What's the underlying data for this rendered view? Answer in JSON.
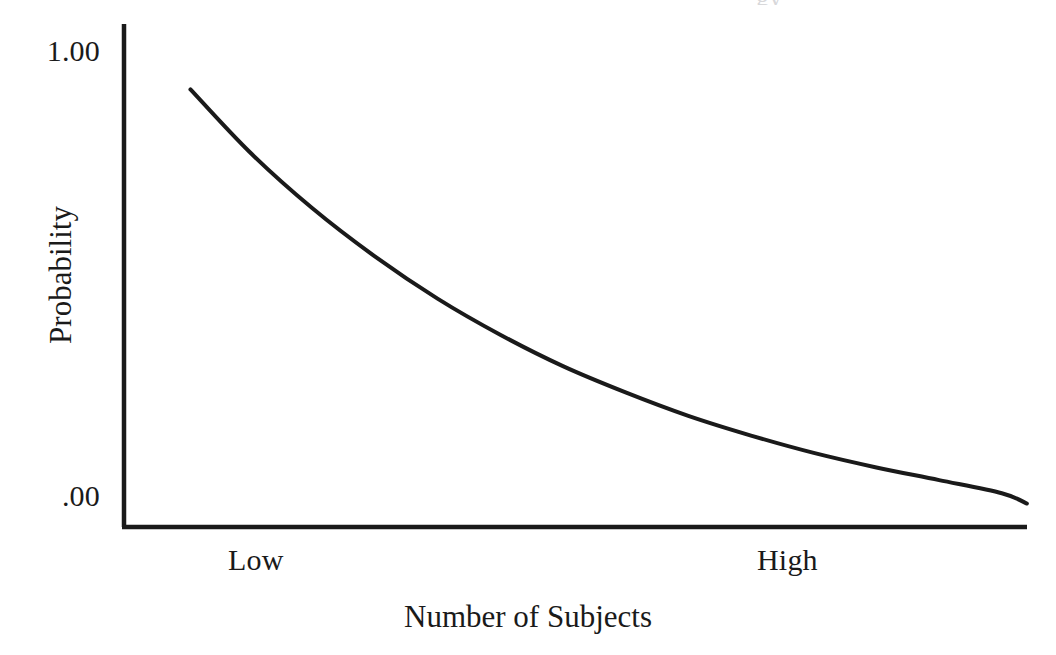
{
  "figure": {
    "background_color": "#ffffff",
    "ink_color": "#1a1a1a",
    "artifact_glyph": "gy"
  },
  "axes": {
    "y_title": "Probability",
    "x_title": "Number of Subjects",
    "y_ticks": [
      "1.00",
      ".00"
    ],
    "x_ticks": [
      "Low",
      "High"
    ]
  },
  "chart_data": {
    "type": "line",
    "title": "",
    "subtitle": "",
    "xlabel": "Number of Subjects",
    "ylabel": "Probability",
    "xlim": [
      0,
      1
    ],
    "ylim": [
      0,
      1
    ],
    "x_tick_labels": [
      "Low",
      "High"
    ],
    "x_tick_values": [
      0.08,
      0.72
    ],
    "y_tick_labels": [
      "1.00",
      ".00"
    ],
    "y_tick_values": [
      1.0,
      0.0
    ],
    "grid": false,
    "legend": null,
    "annotations": [],
    "series": [
      {
        "name": "Probability",
        "color": "#1a1a1a",
        "line_width": 4,
        "x": [
          0.053,
          0.1,
          0.15,
          0.2,
          0.25,
          0.3,
          0.35,
          0.4,
          0.45,
          0.5,
          0.55,
          0.6,
          0.65,
          0.7,
          0.72
        ],
        "y": [
          0.933,
          0.8,
          0.68,
          0.577,
          0.487,
          0.41,
          0.343,
          0.287,
          0.237,
          0.195,
          0.158,
          0.127,
          0.1,
          0.072,
          0.05
        ]
      }
    ]
  }
}
